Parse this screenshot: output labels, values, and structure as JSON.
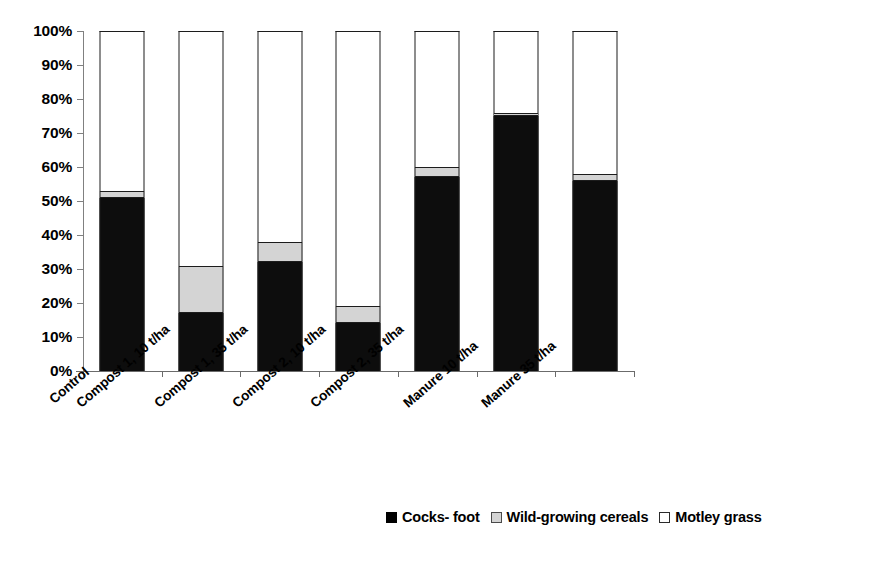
{
  "chart_data": {
    "type": "bar",
    "subtype": "stacked-100-percent",
    "title": "",
    "subtitle": "",
    "xlabel": "",
    "ylabel": "",
    "ylim": [
      0,
      100
    ],
    "yticks": [
      "0%",
      "10%",
      "20%",
      "30%",
      "40%",
      "50%",
      "60%",
      "70%",
      "80%",
      "90%",
      "100%"
    ],
    "ytick_values": [
      0,
      10,
      20,
      30,
      40,
      50,
      60,
      70,
      80,
      90,
      100
    ],
    "grid": false,
    "legend_position": "bottom-right",
    "orientation": "vertical",
    "categories": [
      "Control",
      "Compost 1, 10 t/ha",
      "Compost 1, 35 t/ha",
      "Compost 2, 10 t/ha",
      "Compost 2, 35 t/ha",
      "Manure 10 t/ha",
      "Manure 35 t/ha"
    ],
    "series": [
      {
        "name": "Cocks- foot",
        "color": "#0d0d0d",
        "swatch": "sw-black",
        "values": [
          51,
          17,
          32,
          14,
          57,
          75,
          56
        ]
      },
      {
        "name": "Wild-growing cereals",
        "color": "#d4d4d4",
        "swatch": "sw-gray",
        "values": [
          2,
          14,
          6,
          5,
          3,
          1,
          2
        ]
      },
      {
        "name": "Motley grass",
        "color": "#ffffff",
        "swatch": "sw-white",
        "values": [
          47,
          69,
          62,
          81,
          40,
          24,
          42
        ]
      }
    ]
  },
  "legend": {
    "items": [
      {
        "label": "Cocks- foot",
        "swatch": "sw-black"
      },
      {
        "label": "Wild-growing cereals",
        "swatch": "sw-gray"
      },
      {
        "label": "Motley grass",
        "swatch": "sw-white"
      }
    ]
  },
  "colors": {
    "cocksfoot": "#0d0d0d",
    "cereals": "#d4d4d4",
    "motley": "#ffffff",
    "axis": "#6b6b6b",
    "outline": "#1c1c1c",
    "background": "#ffffff"
  }
}
